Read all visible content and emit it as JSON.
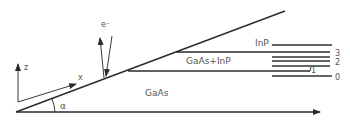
{
  "diagram": {
    "regions": {
      "substrate": "GaAs",
      "mixed_layer": "GaAs+InP",
      "top_layer": "InP"
    },
    "axes": {
      "z_label": "z",
      "x_label": "x",
      "angle_label": "α"
    },
    "beam": {
      "label": "e⁻"
    },
    "layer_indices": [
      "3",
      "2",
      "1",
      "0"
    ],
    "colors": {
      "line": "#2a2a2a",
      "text": "#555555",
      "background": "#ffffff"
    }
  }
}
